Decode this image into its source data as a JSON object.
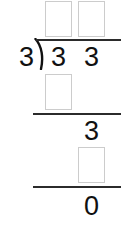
{
  "problem": {
    "type": "long-division",
    "divisor": "3",
    "dividend": "33",
    "quotient_answer": "11"
  },
  "divisor": {
    "value": "3"
  },
  "dividend": {
    "digits": [
      {
        "value": "3"
      },
      {
        "value": "3"
      }
    ]
  },
  "quotient_boxes": [
    {
      "value": "",
      "placeholder": ""
    },
    {
      "value": "",
      "placeholder": ""
    }
  ],
  "steps": [
    {
      "name": "partial-product-1",
      "box": {
        "value": "",
        "placeholder": ""
      }
    },
    {
      "name": "remainder-bring-down",
      "text": "3"
    },
    {
      "name": "partial-product-2",
      "box": {
        "value": "",
        "placeholder": ""
      }
    },
    {
      "name": "final-remainder",
      "text": "0"
    }
  ],
  "colors": {
    "ink": "#111111",
    "rule": "#2b2b2b",
    "box_border": "#cccccc",
    "background": "#ffffff"
  }
}
